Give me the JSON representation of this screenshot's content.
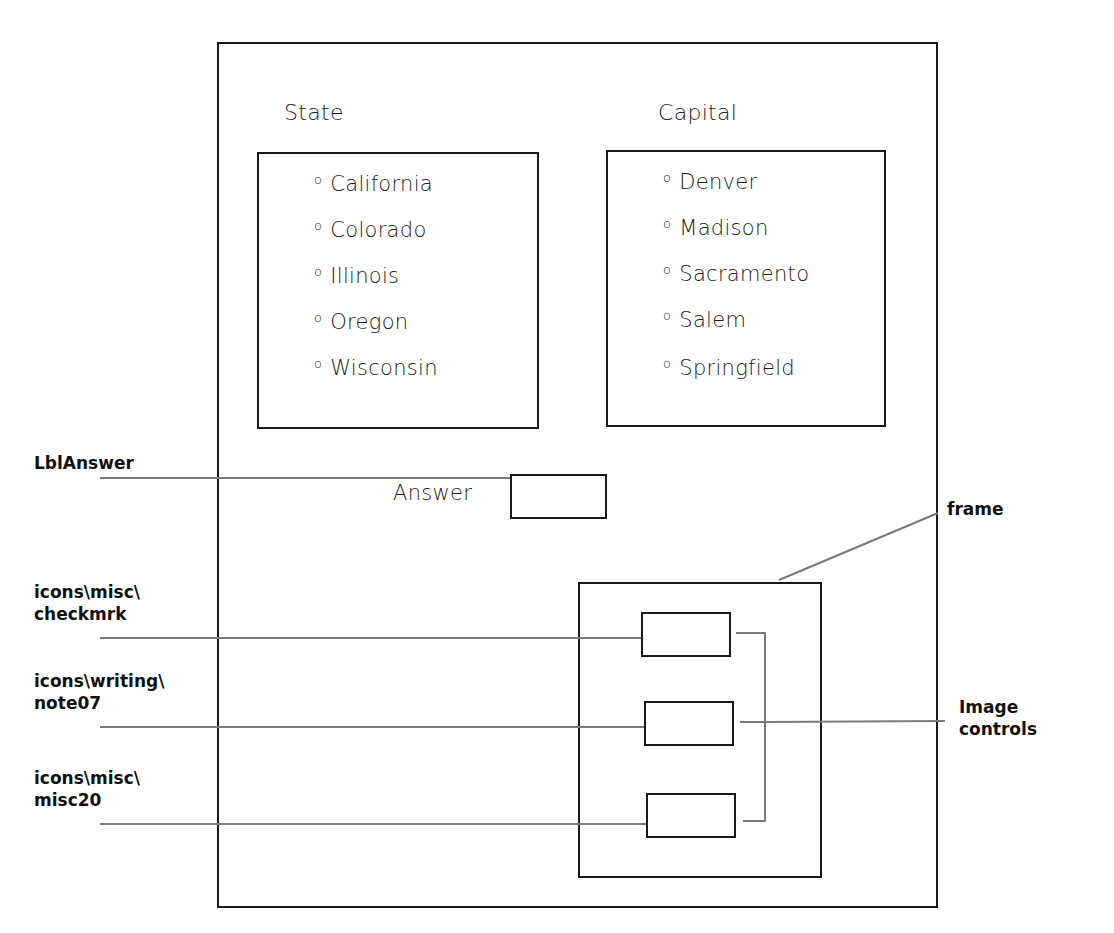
{
  "form": {
    "state_list": {
      "title": "State",
      "bullet": "o",
      "items": [
        "California",
        "Colorado",
        "Illinois",
        "Oregon",
        "Wisconsin"
      ]
    },
    "capital_list": {
      "title": "Capital",
      "bullet": "o",
      "items": [
        "Denver",
        "Madison",
        "Sacramento",
        "Salem",
        "Springfield"
      ]
    },
    "answer": {
      "label": "Answer",
      "value": ""
    },
    "frame": {
      "image_controls": [
        {
          "source": "icons\\misc\\checkmrk"
        },
        {
          "source": "icons\\writing\\note07"
        },
        {
          "source": "icons\\misc\\misc20"
        }
      ]
    }
  },
  "callouts": {
    "lbl_answer": "LblAnswer",
    "checkmrk": "icons\\misc\\\ncheckmrk",
    "note07": "icons\\writing\\\nnote07",
    "misc20": "icons\\misc\\\nmisc20",
    "frame": "frame",
    "image_controls": "Image\ncontrols"
  },
  "colors": {
    "outline": "#1a1a1a",
    "leader_line": "#7a7a7a",
    "background": "#ffffff"
  }
}
